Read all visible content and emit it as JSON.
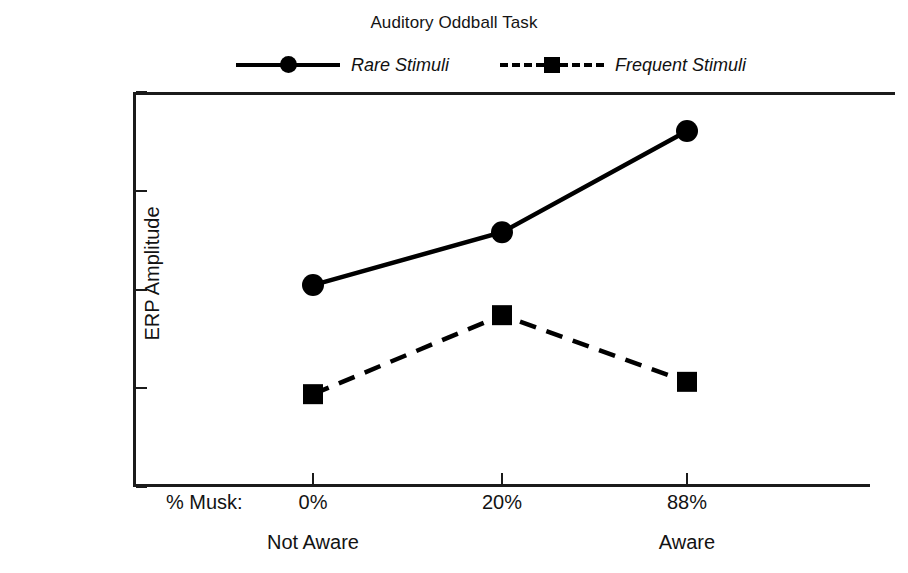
{
  "chart_data": {
    "type": "line",
    "title": "Auditory Oddball Task",
    "xlabel": "% Musk:",
    "ylabel": "ERP Amplitude",
    "categories": [
      "0%",
      "20%",
      "88%"
    ],
    "group_labels": [
      "Not Aware",
      "",
      "Aware"
    ],
    "ylim": [
      200,
      1000
    ],
    "yticks": [
      200,
      400,
      600,
      800,
      1000
    ],
    "ytick_labels": [
      "200",
      "400",
      "600",
      "800",
      "1000"
    ],
    "grid": false,
    "legend_position": "top",
    "series": [
      {
        "name": "Rare Stimuli",
        "marker": "circle",
        "linestyle": "solid",
        "color": "#000000",
        "values": [
          609,
          716,
          921
        ]
      },
      {
        "name": "Frequent Stimuli",
        "marker": "square",
        "linestyle": "dashed",
        "color": "#000000",
        "values": [
          388,
          548,
          413
        ]
      }
    ]
  },
  "legend": {
    "entries": [
      {
        "label": "Rare Stimuli"
      },
      {
        "label": "Frequent Stimuli"
      }
    ]
  }
}
